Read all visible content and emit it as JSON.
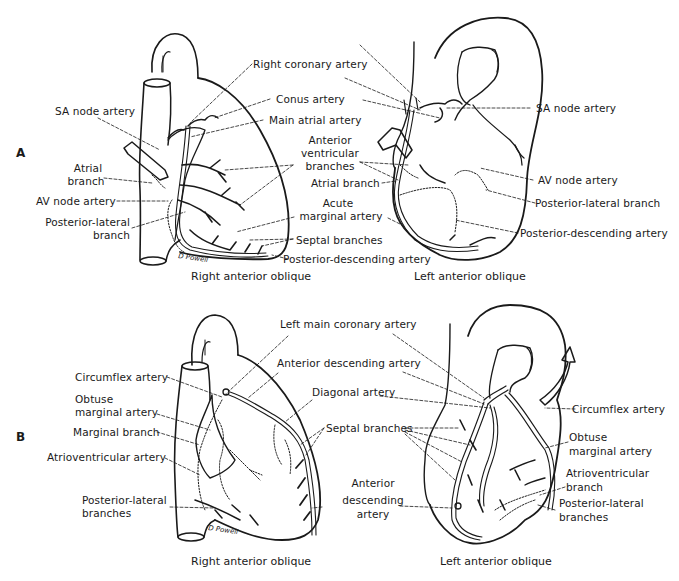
{
  "figure": {
    "panels": [
      {
        "letter": "A",
        "views": [
          {
            "caption": "Right anterior oblique",
            "labels": {
              "sa_node_artery": "SA node artery",
              "atrial_branch_1": "Atrial",
              "atrial_branch_2": "branch",
              "av_node_artery": "AV node artery",
              "posterior_lateral_1": "Posterior-lateral",
              "posterior_lateral_2": "branch"
            },
            "signature": "D Powell"
          },
          {
            "caption": "Left anterior oblique",
            "labels": {
              "sa_node_artery": "SA node artery",
              "av_node_artery": "AV node artery",
              "posterior_lateral_branch": "Posterior-lateral branch",
              "posterior_descending_artery": "Posterior-descending artery"
            }
          }
        ],
        "shared_labels": {
          "right_coronary_artery": "Right coronary artery",
          "conus_artery": "Conus artery",
          "main_atrial_artery": "Main atrial artery",
          "anterior_ventricular_1": "Anterior",
          "anterior_ventricular_2": "ventricular",
          "anterior_ventricular_3": "branches",
          "atrial_branch": "Atrial branch",
          "acute_marginal_1": "Acute",
          "acute_marginal_2": "marginal artery",
          "septal_branches": "Septal branches",
          "posterior_descending_artery": "Posterior-descending artery"
        }
      },
      {
        "letter": "B",
        "views": [
          {
            "caption": "Right anterior oblique",
            "labels": {
              "circumflex_artery": "Circumflex artery",
              "obtuse_marginal_1": "Obtuse",
              "obtuse_marginal_2": "marginal artery",
              "marginal_branch": "Marginal branch",
              "atrioventricular_artery": "Atrioventricular artery",
              "posterior_lateral_1": "Posterior-lateral",
              "posterior_lateral_2": "branches"
            },
            "signature": "D Powell"
          },
          {
            "caption": "Left anterior oblique",
            "labels": {
              "circumflex_artery": "Circumflex artery",
              "obtuse_marginal_1": "Obtuse",
              "obtuse_marginal_2": "marginal artery",
              "atrioventricular_1": "Atrioventricular",
              "atrioventricular_2": "branch",
              "posterior_lateral_1": "Posterior-lateral",
              "posterior_lateral_2": "branches"
            }
          }
        ],
        "shared_labels": {
          "left_main_coronary_artery": "Left main coronary artery",
          "anterior_descending_artery": "Anterior descending artery",
          "diagonal_artery": "Diagonal artery",
          "septal_branches": "Septal branches",
          "anterior_descending_1": "Anterior",
          "anterior_descending_2": "descending",
          "anterior_descending_3": "artery"
        }
      }
    ],
    "colors": {
      "ink": "#1a1a1a",
      "background": "#ffffff"
    }
  }
}
